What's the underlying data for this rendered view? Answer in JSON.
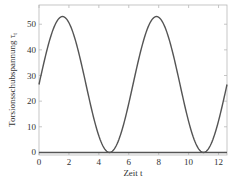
{
  "chart_data": {
    "type": "line",
    "title": "",
    "xlabel": "Zeit t",
    "ylabel": "Torsionsschubspannung τ",
    "ylabel_subscript": "t",
    "xlim": [
      0,
      12.566
    ],
    "ylim": [
      -1,
      57.5
    ],
    "xticks": [
      0,
      2,
      4,
      6,
      8,
      10,
      12
    ],
    "yticks": [
      0,
      10,
      20,
      30,
      40,
      50
    ],
    "grid": false,
    "legend": null,
    "series": [
      {
        "name": "τ_t(t)",
        "description": "26.5·(1 + sin t)",
        "x": [
          0,
          0.5,
          1.0,
          1.5708,
          2.0,
          2.5,
          3.0,
          3.5,
          4.0,
          4.7124,
          5.5,
          6.0,
          6.5,
          7.0,
          7.854,
          8.5,
          9.0,
          9.5,
          10.0,
          10.9956,
          11.5,
          12.0,
          12.566
        ],
        "y": [
          26.5,
          39.2,
          48.8,
          53.0,
          50.6,
          42.4,
          30.2,
          17.2,
          6.4,
          0.0,
          7.9,
          19.1,
          31.6,
          43.9,
          53.0,
          47.2,
          37.4,
          25.7,
          12.1,
          0.0,
          3.3,
          12.3,
          26.5
        ]
      },
      {
        "name": "zero-line",
        "x": [
          0,
          12.566
        ],
        "y": [
          0,
          0
        ]
      }
    ]
  }
}
